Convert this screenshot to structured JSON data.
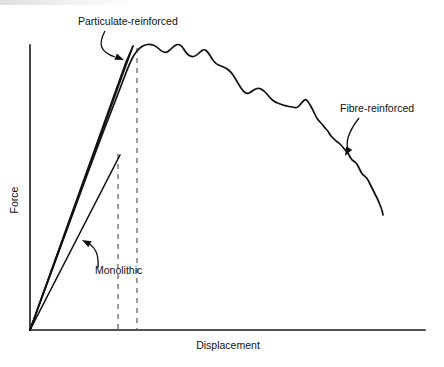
{
  "figure": {
    "title_visible": false,
    "background_color": "#ffffff",
    "line_color": "#111111",
    "dashed_line_color": "#4d4d4d"
  },
  "axes": {
    "x_label": "Displacement",
    "y_label": "Force",
    "x_label_pos": {
      "x": 228,
      "y": 349
    },
    "y_label_pos": {
      "x": 18,
      "y": 200
    },
    "x_axis": {
      "x1": 30,
      "y1": 330,
      "x2": 425,
      "y2": 330
    },
    "y_axis": {
      "x1": 30,
      "y1": 45,
      "x2": 30,
      "y2": 330
    },
    "ticks": "none",
    "grid": false
  },
  "annotations": [
    {
      "name": "particulate-reinforced",
      "label": "Particulate-reinforced",
      "text_x": 78,
      "text_y": 25,
      "anchor": "start",
      "leader_path": "M 105 31 C 98 44, 100 52, 115 57",
      "arrow_tip": {
        "x": 124,
        "y": 60
      },
      "arrow_angle": 22
    },
    {
      "name": "fibre-reinforced",
      "label": "Fibre-reinforced",
      "text_x": 340,
      "text_y": 112,
      "anchor": "start",
      "leader_path": "M 359 118 C 349 131, 344 142, 349 151",
      "arrow_tip": {
        "x": 345,
        "y": 156
      },
      "arrow_angle": 118
    },
    {
      "name": "monolithic",
      "label": "Monolithic",
      "text_x": 95,
      "text_y": 274,
      "anchor": "start",
      "leader_path": "M 98 268 C 99 255, 96 248, 88 243",
      "arrow_tip": {
        "x": 82,
        "y": 240
      },
      "arrow_angle": 208
    }
  ],
  "dashed_markers": [
    {
      "name": "monolithic-failure-marker",
      "x": 118,
      "y_top": 154,
      "y_bottom": 330
    },
    {
      "name": "particulate-failure-marker",
      "x": 137,
      "y_top": 48,
      "y_bottom": 330
    }
  ],
  "chart_data": {
    "type": "line",
    "title": "",
    "xlabel": "Displacement",
    "ylabel": "Force",
    "xlim": [
      0,
      1
    ],
    "ylim": [
      0,
      1
    ],
    "grid": false,
    "legend": "annotated in-plot",
    "axis_units": "arbitrary (schematic load-displacement curves)",
    "series": [
      {
        "name": "Monolithic",
        "style": "solid-straight",
        "behaviour": "linear-elastic then catastrophic failure",
        "points_px": [
          [
            30,
            330
          ],
          [
            120,
            155
          ]
        ],
        "points_norm": [
          [
            0.0,
            0.0
          ],
          [
            0.228,
            0.614
          ]
        ]
      },
      {
        "name": "Particulate-reinforced (lower modulus branch)",
        "style": "solid-straight",
        "behaviour": "linear-elastic then catastrophic failure",
        "points_px": [
          [
            30,
            330
          ],
          [
            133,
            46
          ]
        ],
        "points_norm": [
          [
            0.0,
            0.0
          ],
          [
            0.261,
            0.996
          ]
        ]
      },
      {
        "name": "Particulate-reinforced (upper modulus branch)",
        "style": "solid-straight",
        "behaviour": "linear-elastic then catastrophic failure",
        "points_px": [
          [
            30,
            330
          ],
          [
            126,
            62
          ],
          [
            133,
            46
          ]
        ],
        "points_norm": [
          [
            0.0,
            0.0
          ],
          [
            0.243,
            0.94
          ],
          [
            0.261,
            0.996
          ]
        ]
      },
      {
        "name": "Fibre-reinforced",
        "style": "solid-serrated-curve",
        "behaviour": "rises to peak then long serrated graceful decline (fibre pull-out)",
        "points_px": [
          [
            30,
            330
          ],
          [
            70,
            221
          ],
          [
            100,
            140
          ],
          [
            118,
            94
          ],
          [
            130,
            62
          ],
          [
            137,
            50
          ],
          [
            144,
            45
          ],
          [
            150,
            44
          ],
          [
            156,
            46
          ],
          [
            161,
            51
          ],
          [
            166,
            53
          ],
          [
            170,
            50
          ],
          [
            174,
            46
          ],
          [
            178,
            44
          ],
          [
            182,
            46
          ],
          [
            186,
            53
          ],
          [
            191,
            57
          ],
          [
            196,
            56
          ],
          [
            200,
            52
          ],
          [
            204,
            49
          ],
          [
            208,
            52
          ],
          [
            212,
            59
          ],
          [
            216,
            64
          ],
          [
            221,
            66
          ],
          [
            226,
            68
          ],
          [
            231,
            72
          ],
          [
            235,
            78
          ],
          [
            239,
            85
          ],
          [
            243,
            91
          ],
          [
            247,
            94
          ],
          [
            251,
            92
          ],
          [
            255,
            89
          ],
          [
            259,
            88
          ],
          [
            263,
            90
          ],
          [
            267,
            94
          ],
          [
            271,
            99
          ],
          [
            275,
            102
          ],
          [
            280,
            104
          ],
          [
            286,
            106
          ],
          [
            292,
            107
          ],
          [
            297,
            108
          ],
          [
            300,
            105
          ],
          [
            303,
            101
          ],
          [
            306,
            99
          ],
          [
            309,
            103
          ],
          [
            313,
            110
          ],
          [
            316,
            117
          ],
          [
            319,
            121
          ],
          [
            322,
            124
          ],
          [
            325,
            128
          ],
          [
            328,
            131
          ],
          [
            330,
            135
          ],
          [
            333,
            138
          ],
          [
            336,
            141
          ],
          [
            339,
            143
          ],
          [
            342,
            146
          ],
          [
            345,
            150
          ],
          [
            348,
            153
          ],
          [
            350,
            157
          ],
          [
            352,
            160
          ],
          [
            355,
            162
          ],
          [
            357,
            164
          ],
          [
            359,
            168
          ],
          [
            361,
            172
          ],
          [
            363,
            175
          ],
          [
            366,
            177
          ],
          [
            368,
            180
          ],
          [
            370,
            184
          ],
          [
            372,
            188
          ],
          [
            374,
            192
          ],
          [
            376,
            196
          ],
          [
            378,
            200
          ],
          [
            380,
            205
          ],
          [
            382,
            210
          ],
          [
            383,
            215
          ]
        ],
        "peak_px": [
          150,
          44
        ],
        "end_px": [
          383,
          215
        ]
      }
    ],
    "key_events": [
      {
        "name": "monolithic_failure",
        "x_px": 120,
        "y_px": 155,
        "note": "lowest failure strain and load"
      },
      {
        "name": "particulate_failure",
        "x_px": 133,
        "y_px": 46,
        "note": "higher peak load, still brittle"
      },
      {
        "name": "fibre_peak",
        "x_px": 150,
        "y_px": 44,
        "note": "peak load, then non-catastrophic decline"
      }
    ]
  }
}
